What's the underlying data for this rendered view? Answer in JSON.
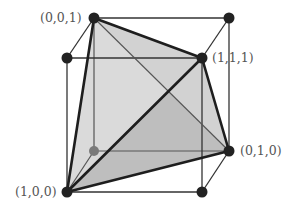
{
  "diagram": {
    "colors": {
      "background": "#ffffff",
      "cube_edge": "#3a3a3a",
      "tetra_edge": "#1e1e1e",
      "face_light": "#d9d9d9",
      "face_dark": "#bdbdbd",
      "vertex": "#222222",
      "hidden_vertex": "#777777",
      "label": "#555555"
    },
    "vertices": [
      {
        "id": "v001",
        "label": "(0,0,1)",
        "x": 94,
        "y": 18,
        "hidden": false
      },
      {
        "id": "vbtl",
        "label": "",
        "x": 67,
        "y": 58,
        "hidden": false
      },
      {
        "id": "v111",
        "label": "(1,1,1)",
        "x": 202,
        "y": 58,
        "hidden": false
      },
      {
        "id": "vbtr",
        "label": "",
        "x": 229,
        "y": 18,
        "hidden": false
      },
      {
        "id": "v000",
        "label": "",
        "x": 94,
        "y": 151,
        "hidden": true
      },
      {
        "id": "v010",
        "label": "(0,1,0)",
        "x": 229,
        "y": 151,
        "hidden": false
      },
      {
        "id": "v100",
        "label": "(1,0,0)",
        "x": 67,
        "y": 192,
        "hidden": false
      },
      {
        "id": "v110",
        "label": "",
        "x": 202,
        "y": 192,
        "hidden": false
      }
    ],
    "labels": {
      "v001": "(0,0,1)",
      "v111": "(1,1,1)",
      "v010": "(0,1,0)",
      "v100": "(1,0,0)"
    }
  }
}
